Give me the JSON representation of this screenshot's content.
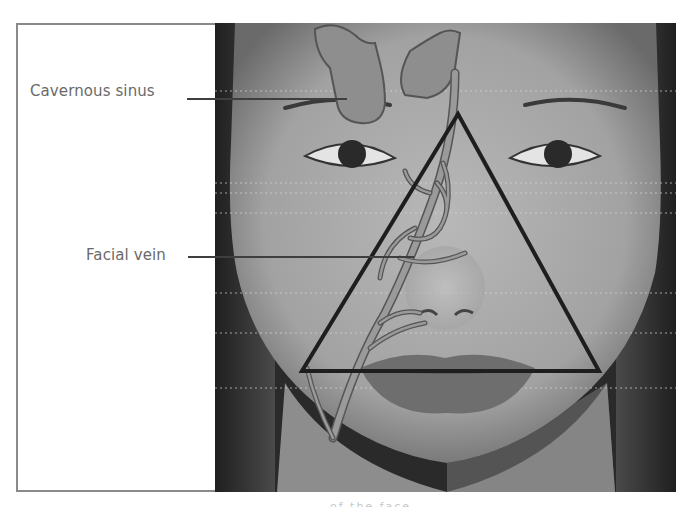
{
  "figure": {
    "labels": [
      {
        "id": "cavernous-sinus",
        "text": "Cavernous sinus"
      },
      {
        "id": "facial-vein",
        "text": "Facial vein"
      }
    ],
    "caption_fragment": "of the face"
  },
  "colors": {
    "frame_border": "#8a8a8a",
    "label_text": "#6a6a6a",
    "leader_line": "#3e3e3e",
    "triangle_stroke": "#1e1e1e",
    "vein_fill": "#8c8c8c",
    "skin": "#a9a9a9",
    "hair": "#262626"
  }
}
